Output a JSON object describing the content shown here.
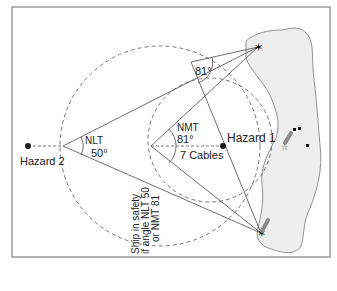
{
  "diagram": {
    "type": "horizontal-danger-angle",
    "colors": {
      "frame": "#6a6a6a",
      "line": "#4a4a4a",
      "dashed": "#555555",
      "land_fill": "#eeeeee",
      "land_stroke": "#777777",
      "hazard": "#1a1a1a",
      "leading_mark": "#8a8a8a",
      "text": "#222222"
    },
    "labels": {
      "hazard1": "Hazard 1",
      "hazard2": "Hazard 2",
      "nlt_label": "NLT",
      "nlt_angle": "50°",
      "nmt_label": "NMT",
      "nmt_angle": "81°",
      "top_angle": "81°",
      "distance": "7 Cables",
      "safety_line1": "Ship in safety",
      "safety_line2": "if angle NLT 50",
      "safety_line3": "or NMT 81"
    },
    "points": {
      "landmark_north": {
        "x": 258,
        "y": 47
      },
      "landmark_south": {
        "x": 261,
        "y": 233
      },
      "nlt_vertex": {
        "x": 63,
        "y": 146
      },
      "nmt_vertex": {
        "x": 151,
        "y": 146
      },
      "top_apex": {
        "x": 191,
        "y": 62
      },
      "hazard1": {
        "x": 223,
        "y": 146
      },
      "hazard2": {
        "x": 28,
        "y": 146
      }
    }
  }
}
